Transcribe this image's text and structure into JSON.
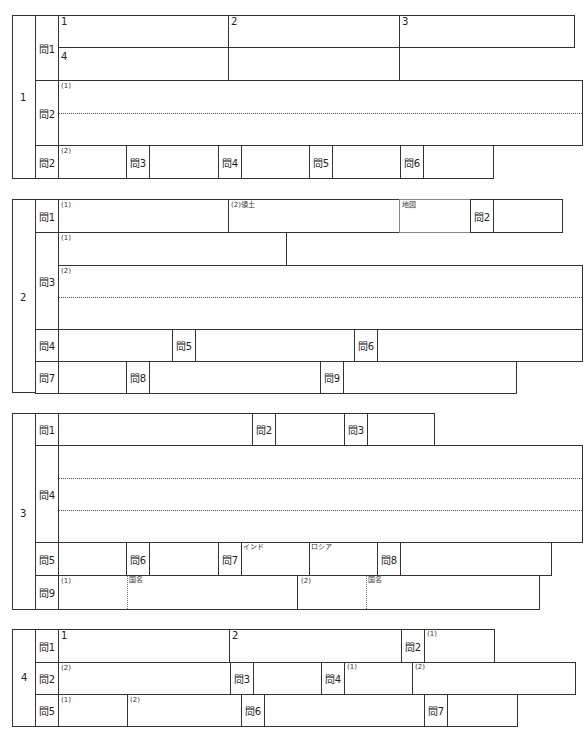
{
  "sections": [
    {
      "number": "1",
      "rows": [
        {
          "q": "問1",
          "cells": [
            "1",
            "2",
            "3",
            "4"
          ]
        },
        {
          "q": "問2",
          "cells": [
            "(1)"
          ]
        },
        {
          "q": "問2",
          "cells": [
            "(2)"
          ],
          "others": [
            "問3",
            "問4",
            "問5",
            "問6"
          ]
        }
      ]
    },
    {
      "number": "2",
      "rows": [
        {
          "q": "問1",
          "cells": [
            "(1)",
            "(2)領土",
            "地図"
          ],
          "others": [
            "問2"
          ]
        },
        {
          "q": "問3",
          "cells": [
            "(1)",
            "(2)"
          ]
        },
        {
          "q": "問4",
          "others": [
            "問5",
            "問6"
          ]
        },
        {
          "q": "問7",
          "others": [
            "問8",
            "問9"
          ]
        }
      ]
    },
    {
      "number": "3",
      "rows": [
        {
          "q": "問1",
          "others": [
            "問2",
            "問3"
          ]
        },
        {
          "q": "問4"
        },
        {
          "q": "問5",
          "others": [
            "問6",
            "問7",
            "問8"
          ],
          "cells": [
            "インド",
            "ロシア"
          ]
        },
        {
          "q": "問9",
          "cells": [
            "(1)",
            "国名",
            "(2)",
            "国名"
          ]
        }
      ]
    },
    {
      "number": "4",
      "rows": [
        {
          "q": "問1",
          "cells": [
            "1",
            "2"
          ],
          "others": [
            "問2"
          ],
          "sub": [
            "(1)"
          ]
        },
        {
          "q": "問2",
          "cells": [
            "(2)"
          ],
          "others": [
            "問3",
            "問4"
          ],
          "sub": [
            "(1)",
            "(2)"
          ]
        },
        {
          "q": "問5",
          "cells": [
            "(1)",
            "(2)"
          ],
          "others": [
            "問6",
            "問7"
          ]
        }
      ]
    }
  ]
}
